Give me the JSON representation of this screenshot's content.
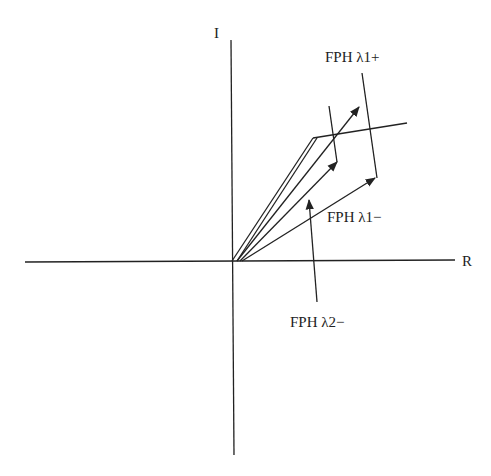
{
  "diagram": {
    "type": "phasor-diagram",
    "axes": {
      "real_label": "R",
      "imag_label": "I"
    },
    "labels": {
      "fph_l1_plus": "FPH λ1+",
      "fph_l1_minus": "FPH λ1−",
      "fph_l2_minus": "FPH λ2−"
    },
    "colors": {
      "line": "#222222",
      "background": "#ffffff"
    }
  }
}
